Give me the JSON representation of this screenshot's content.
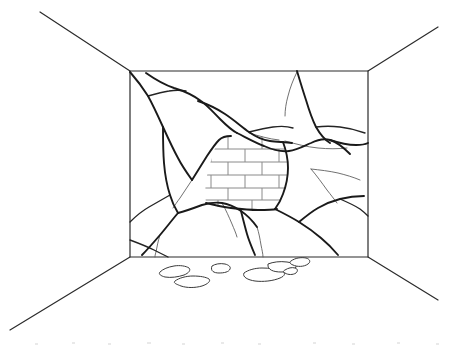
{
  "illustration": {
    "title": "Cracked Interior Wall Revealing Brickwork",
    "style": "black-and-white line drawing",
    "width": 459,
    "height": 349,
    "background_color": "#ffffff",
    "line_color": "#2b2b2b",
    "crack_color": "#1a1a1a",
    "mortar_color": "#8a8a8a",
    "rubble_color": "#3a3a3a"
  },
  "room": {
    "label": "One-point perspective room interior",
    "back_wall": {
      "label": "Back wall",
      "corners": {
        "top_left": [
          130,
          71
        ],
        "top_right": [
          368,
          71
        ],
        "bottom_right": [
          368,
          257
        ],
        "bottom_left": [
          130,
          257
        ]
      },
      "outline_path": "M130,71 L368,71 L368,257 L130,257 Z"
    },
    "perspective_lines": [
      {
        "name": "ceiling-left-edge",
        "path": "M40,12 L130,71"
      },
      {
        "name": "ceiling-right-edge",
        "path": "M438,27 L368,71"
      },
      {
        "name": "floor-left-edge",
        "path": "M10,330 L130,257"
      },
      {
        "name": "floor-right-edge",
        "path": "M438,300 L368,257"
      }
    ]
  },
  "cracks": {
    "label": "Crack network across the plaster wall",
    "major": [
      {
        "name": "crack-upper-left-diagonal",
        "path": "M130,72 C137,80 143,88 148,96 C153,105 158,116 163,127 C168,138 173,149 178,158 C182,166 187,173 192,180"
      },
      {
        "name": "crack-top-left-to-center",
        "path": "M146,73 C156,80 165,85 174,88 C184,91 193,95 201,101 C208,106 214,113 220,119 C226,125 231,130 237,133"
      },
      {
        "name": "crack-center-upper-horizontal",
        "path": "M198,101 C207,104 216,108 225,114 C234,120 242,127 249,132 C256,137 263,140 270,141 C277,142 285,142 292,143"
      },
      {
        "name": "crack-center-to-right-ridge",
        "path": "M237,133 C247,138 256,143 264,146 C273,150 281,152 289,151 C297,150 304,146 311,143 C317,140 323,138 330,140 C337,142 344,148 350,154"
      },
      {
        "name": "crack-right-upper-descend",
        "path": "M297,71 C300,81 303,91 306,100 C309,110 312,119 316,127 C320,134 325,140 330,143"
      },
      {
        "name": "crack-right-edge-run",
        "path": "M330,140 C339,143 348,145 356,145 C362,145 366,144 368,143"
      },
      {
        "name": "crack-brick-left-boundary",
        "path": "M192,180 C197,172 202,164 207,156 C211,150 215,144 219,140 C222,137 226,136 231,136"
      },
      {
        "name": "crack-brick-right-boundary",
        "path": "M283,142 C286,150 288,159 288,168 C288,177 286,186 283,194 C281,200 278,205 275,209"
      },
      {
        "name": "crack-brick-bottom",
        "path": "M206,203 C214,205 222,207 231,208 C240,209 249,210 258,210 C266,210 272,210 277,209"
      },
      {
        "name": "crack-lower-left-vertical",
        "path": "M163,127 C163,139 163,151 164,163 C165,175 167,186 170,195 C172,202 175,208 178,213"
      },
      {
        "name": "crack-lower-center-junction",
        "path": "M178,213 C186,211 194,208 202,205 C209,203 215,202 222,203 C229,204 235,207 241,211 C247,215 252,220 257,227"
      },
      {
        "name": "crack-lower-left-to-floor",
        "path": "M178,213 C172,220 166,228 160,235 C154,242 148,249 142,255"
      },
      {
        "name": "crack-lower-center-to-floor",
        "path": "M241,211 C243,219 245,227 247,234 C249,241 252,248 255,255"
      },
      {
        "name": "crack-lower-right-ridge",
        "path": "M275,209 C283,213 291,217 299,222 C307,227 314,232 321,238 C327,243 333,249 338,255"
      },
      {
        "name": "crack-right-lower-descend",
        "path": "M299,222 C305,217 311,212 318,208 C325,204 332,201 340,199 C348,197 356,196 364,196"
      }
    ],
    "medium": [
      {
        "name": "crack-branch-upper-left-a",
        "path": "M148,96 C155,94 162,92 169,91 C175,90 181,90 186,91"
      },
      {
        "name": "crack-branch-upper-right-a",
        "path": "M249,132 C257,130 265,128 273,127 C280,126 287,126 293,128"
      },
      {
        "name": "crack-branch-right-mid",
        "path": "M316,127 C324,126 332,126 340,127 C349,128 357,130 365,133"
      },
      {
        "name": "crack-branch-lower-left-b",
        "path": "M170,195 C163,199 156,203 149,207 C142,211 136,216 130,222"
      },
      {
        "name": "crack-branch-floor-left",
        "path": "M130,240 C138,243 146,246 154,250 C160,253 164,255 168,257"
      },
      {
        "name": "crack-branch-right-to-edge",
        "path": "M340,199 C347,202 354,205 360,209 C364,212 366,214 368,216"
      }
    ],
    "minor": [
      {
        "name": "hairline-upper-right-a",
        "path": "M285,141 C296,144 307,147 318,148 C328,149 338,149 347,148"
      },
      {
        "name": "hairline-upper-right-b",
        "path": "M249,133 C259,136 269,139 279,140"
      },
      {
        "name": "hairline-right-fan-a",
        "path": "M311,169 C320,170 329,171 338,173 C346,175 353,177 360,180"
      },
      {
        "name": "hairline-right-fan-b",
        "path": "M311,169 C317,176 322,183 327,190 C331,195 334,199 337,203"
      },
      {
        "name": "hairline-center-drip",
        "path": "M257,227 C259,233 260,239 261,245 C262,250 263,254 263,257"
      },
      {
        "name": "hairline-left-drip",
        "path": "M160,235 C158,241 157,247 156,252 C155,255 155,256 155,257"
      },
      {
        "name": "hairline-top-right-thin",
        "path": "M297,72 C293,80 290,88 288,96 C286,103 285,110 285,116"
      },
      {
        "name": "hairline-brick-left-thin",
        "path": "M192,180 C188,186 184,192 180,198 C177,202 175,205 173,208"
      },
      {
        "name": "hairline-lower-mid-thin",
        "path": "M222,203 C226,210 229,217 232,224 C234,229 236,233 237,237"
      }
    ]
  },
  "brickwork": {
    "label": "Exposed brick patch behind broken plaster",
    "pattern": "running bond",
    "bounds": {
      "x": 210,
      "y": 136,
      "width": 74,
      "height": 76
    },
    "course_count": 6,
    "course_height": 13,
    "brick_width": 34,
    "clip_path": "M231,136 C240,135 250,135 259,136 C268,137 276,139 283,142 C286,150 288,159 288,168 C288,177 286,186 283,194 C281,200 278,205 275,209 C266,210 257,210 248,210 C238,210 228,209 219,207 C213,206 209,205 206,203 C205,196 205,189 206,182 C207,174 209,166 212,158 C214,150 217,143 219,140 C222,137 226,136 231,136 Z",
    "horizontal_mortar_lines": [
      {
        "name": "course-line-1",
        "y": 149
      },
      {
        "name": "course-line-2",
        "y": 162
      },
      {
        "name": "course-line-3",
        "y": 175
      },
      {
        "name": "course-line-4",
        "y": 188
      },
      {
        "name": "course-line-5",
        "y": 200
      }
    ],
    "vertical_mortar_lines": [
      {
        "name": "head-joint-r1-a",
        "x1": 228,
        "y1": 136,
        "x2": 228,
        "y2": 149
      },
      {
        "name": "head-joint-r1-b",
        "x1": 262,
        "y1": 136,
        "x2": 262,
        "y2": 149
      },
      {
        "name": "head-joint-r2-a",
        "x1": 211,
        "y1": 149,
        "x2": 211,
        "y2": 162
      },
      {
        "name": "head-joint-r2-b",
        "x1": 245,
        "y1": 149,
        "x2": 245,
        "y2": 162
      },
      {
        "name": "head-joint-r2-c",
        "x1": 279,
        "y1": 149,
        "x2": 279,
        "y2": 162
      },
      {
        "name": "head-joint-r3-a",
        "x1": 228,
        "y1": 162,
        "x2": 228,
        "y2": 175
      },
      {
        "name": "head-joint-r3-b",
        "x1": 262,
        "y1": 162,
        "x2": 262,
        "y2": 175
      },
      {
        "name": "head-joint-r4-a",
        "x1": 211,
        "y1": 175,
        "x2": 211,
        "y2": 188
      },
      {
        "name": "head-joint-r4-b",
        "x1": 245,
        "y1": 175,
        "x2": 245,
        "y2": 188
      },
      {
        "name": "head-joint-r4-c",
        "x1": 279,
        "y1": 175,
        "x2": 279,
        "y2": 188
      },
      {
        "name": "head-joint-r5-a",
        "x1": 228,
        "y1": 188,
        "x2": 228,
        "y2": 200
      },
      {
        "name": "head-joint-r5-b",
        "x1": 262,
        "y1": 188,
        "x2": 262,
        "y2": 200
      },
      {
        "name": "head-joint-r6-a",
        "x1": 218,
        "y1": 200,
        "x2": 218,
        "y2": 212
      },
      {
        "name": "head-joint-r6-b",
        "x1": 252,
        "y1": 200,
        "x2": 252,
        "y2": 212
      }
    ]
  },
  "floor_rubble": {
    "label": "Fallen plaster debris on the floor",
    "piece_count": 7,
    "pieces": [
      {
        "name": "rubble-piece-1",
        "path": "M160,272 C163,269 168,267 174,266 C180,265 186,266 189,268 C191,270 189,273 184,275 C178,277 171,278 165,277 C161,276 158,274 160,272 Z"
      },
      {
        "name": "rubble-piece-2",
        "path": "M175,281 C179,278 186,276 193,276 C200,276 206,277 209,279 C211,281 208,284 202,286 C195,288 187,288 181,286 C176,284 173,283 175,281 Z"
      },
      {
        "name": "rubble-piece-3",
        "path": "M212,266 C215,264 220,263 225,264 C229,265 231,267 230,269 C229,272 224,273 219,273 C214,273 210,271 212,266 Z"
      },
      {
        "name": "rubble-piece-4",
        "path": "M244,273 C248,270 255,268 262,268 C270,268 277,269 282,271 C286,273 285,276 280,278 C273,281 263,282 255,281 C248,280 242,277 244,273 Z"
      },
      {
        "name": "rubble-piece-5",
        "path": "M268,264 C273,262 280,261 287,262 C293,263 297,265 296,267 C295,270 288,272 281,272 C274,272 267,270 268,264 Z"
      },
      {
        "name": "rubble-piece-6",
        "path": "M285,270 C288,268 292,267 295,268 C298,269 298,271 296,273 C293,275 288,275 285,273 C283,272 283,271 285,270 Z"
      },
      {
        "name": "rubble-piece-7",
        "path": "M291,261 C295,258 301,257 306,258 C310,259 311,262 308,264 C304,267 297,267 293,265 C290,264 289,262 291,261 Z"
      }
    ]
  },
  "artifacts": {
    "label": "Faint scan specks along the bottom margin",
    "specks": [
      {
        "x": 35,
        "y": 343,
        "w": 3,
        "h": 2
      },
      {
        "x": 72,
        "y": 342,
        "w": 3,
        "h": 2
      },
      {
        "x": 108,
        "y": 343,
        "w": 3,
        "h": 2
      },
      {
        "x": 147,
        "y": 342,
        "w": 4,
        "h": 2
      },
      {
        "x": 182,
        "y": 343,
        "w": 3,
        "h": 2
      },
      {
        "x": 221,
        "y": 342,
        "w": 3,
        "h": 2
      },
      {
        "x": 258,
        "y": 343,
        "w": 3,
        "h": 2
      },
      {
        "x": 313,
        "y": 342,
        "w": 3,
        "h": 2
      },
      {
        "x": 352,
        "y": 343,
        "w": 3,
        "h": 2
      },
      {
        "x": 397,
        "y": 342,
        "w": 3,
        "h": 2
      },
      {
        "x": 436,
        "y": 343,
        "w": 3,
        "h": 2
      }
    ]
  }
}
